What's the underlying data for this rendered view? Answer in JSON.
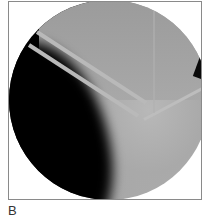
{
  "figure": {
    "panel_label": "B",
    "image_description": "Circular fluoroscopic radiograph showing two parallel wires/pins inserted diagonally through bone, with a third wire crossing",
    "colors": {
      "background": "#ffffff",
      "frame_border": "#8a8a8a",
      "dark_region": "#000000",
      "bone_gray": "#a8a8a8",
      "wire": "#b9b9b9"
    }
  }
}
